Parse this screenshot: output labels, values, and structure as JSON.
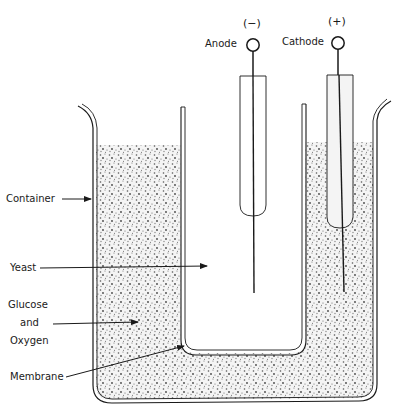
{
  "diagram": {
    "title": "",
    "colors": {
      "ink": "#1a1a1a",
      "paper": "#ffffff",
      "stipple": "#6b6b6b"
    },
    "electrodes": [
      {
        "id": "anode",
        "label": "Anode",
        "polarity": "(−)"
      },
      {
        "id": "cathode",
        "label": "Cathode",
        "polarity": "(+)"
      }
    ],
    "labels": {
      "container": "Container",
      "yeast": "Yeast",
      "glucose_line1": "Glucose",
      "glucose_line2": "and",
      "glucose_line3": "Oxygen",
      "membrane": "Membrane"
    },
    "regions": [
      {
        "id": "yeast-compartment",
        "fill": "white"
      },
      {
        "id": "glucose-oxygen-compartment",
        "fill": "stippled"
      }
    ]
  }
}
